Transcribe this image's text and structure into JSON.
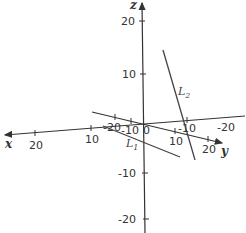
{
  "diagram": {
    "type": "3d-axes-lines",
    "axes": {
      "x": {
        "label": "x",
        "ticks": [
          "20",
          "10",
          "-10",
          "-20"
        ]
      },
      "y": {
        "label": "y",
        "ticks": [
          "-20",
          "-10",
          "10",
          "20"
        ]
      },
      "z": {
        "label": "z",
        "ticks": [
          "20",
          "10",
          "-10",
          "-20"
        ]
      },
      "origin_label": "0"
    },
    "lines": [
      {
        "name": "L",
        "sub": "1"
      },
      {
        "name": "L",
        "sub": "2"
      }
    ],
    "colors": {
      "axis": "#333333",
      "line": "#444444"
    }
  }
}
